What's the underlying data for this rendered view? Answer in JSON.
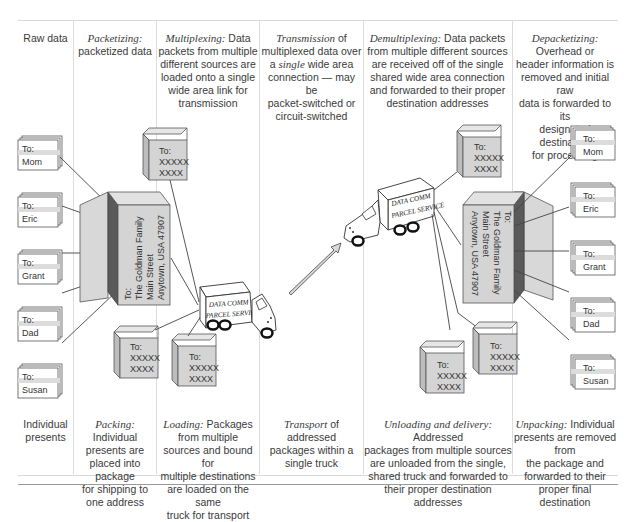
{
  "columns": [
    {
      "id": "raw-data",
      "header_label": "",
      "header_text": "Raw data",
      "footer_label": "",
      "footer_text": "Individual presents"
    },
    {
      "id": "packetizing",
      "header_label": "Packetizing:",
      "header_text": "packetized data",
      "footer_label": "Packing:",
      "footer_text": "Individual presents are placed into package for shipping to one address"
    },
    {
      "id": "multiplexing",
      "header_label": "Multiplexing:",
      "header_text": "Data packets from multiple different sources are loaded onto a single wide area link for transmission",
      "footer_label": "Loading:",
      "footer_text": "Packages from multiple sources and bound for multiple destinations are loaded on the same truck for transport"
    },
    {
      "id": "transmission",
      "header_label": "Transmission",
      "header_text": "of multiplexed data over a single wide area connection — may be packet-switched or circuit-switched",
      "footer_label": "Transport",
      "footer_text": "of addressed packages within a single truck"
    },
    {
      "id": "demultiplexing",
      "header_label": "Demultiplexing:",
      "header_text": "Data packets from multiple different sources are received off of the single shared wide area connection and forwarded to their proper destination addresses",
      "footer_label": "Unloading and delivery:",
      "footer_text": "Addressed packages from multiple sources are unloaded from the single, shared truck and forwarded to their proper destination addresses"
    },
    {
      "id": "depacketizing",
      "header_label": "Depacketizing:",
      "header_text": "Overhead or header information is removed and initial raw data is forwarded to its designated destination for processing",
      "footer_label": "Unpacking:",
      "footer_text": "Individual presents are removed from the package and forwarded to their proper final destination"
    }
  ],
  "header_lines": {
    "raw": [
      "Raw data"
    ],
    "pack": [
      "packetized data"
    ],
    "mux": [
      "Data",
      "packets from multiple",
      "different sources are",
      "loaded onto a single",
      "wide area link for",
      "transmission"
    ],
    "trans": [
      "of",
      "multiplexed data over",
      "over a",
      "wide area",
      "connection — may be",
      "packet-switched  or",
      "circuit-switched"
    ],
    "demux": [
      "Data packets",
      "from multiple different sources",
      "are received off of the single",
      "shared wide area connection",
      "and forwarded to their proper",
      "destination addresses"
    ],
    "depack": [
      "Overhead or",
      "header information is",
      "removed and initial raw",
      "data is forwarded to its",
      "designated destination",
      "for processing"
    ]
  },
  "footer_lines": {
    "raw": [
      "Individual",
      "presents"
    ],
    "pack": [
      "Individual",
      "presents are",
      "placed into package",
      "for shipping to",
      "one address"
    ],
    "mux": [
      "Packages",
      "from multiple",
      "sources and bound for",
      "multiple destinations",
      "are loaded on the same",
      "truck for transport"
    ],
    "trans": [
      "of addressed",
      "packages within a",
      "single truck"
    ],
    "demux": [
      "Addressed",
      "packages from multiple sources",
      "are unloaded from the single,",
      "shared truck and forwarded to",
      "their proper destination",
      "addresses"
    ],
    "depack": [
      "Individual",
      "presents are removed from",
      "the package and",
      "forwarded to their",
      "proper final destination"
    ]
  },
  "labels": {
    "single_word": "single",
    "to_prefix": "To:",
    "recipients": [
      "Mom",
      "Eric",
      "Grant",
      "Dad",
      "Susan"
    ],
    "family_address": [
      "To:",
      "The Goldman Family",
      "Main Street",
      "Anytown, USA 47907"
    ],
    "packet_address": [
      "To:",
      "XXXXX",
      "XXXX"
    ],
    "truck_text": [
      "DATA COMM",
      "PARCEL SERVICE"
    ]
  },
  "colors": {
    "box_face": "#d4d4d4",
    "box_side": "#bdbdbd",
    "box_dark": "#5a5a5a",
    "line": "#444444",
    "divider": "#dcdcdc",
    "arrow_fill": "#d9d9d9"
  }
}
